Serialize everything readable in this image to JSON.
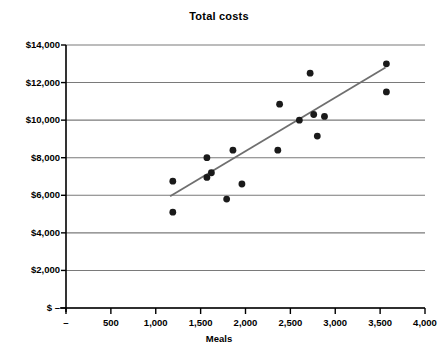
{
  "chart_data": {
    "type": "scatter",
    "title": "Total costs",
    "xlabel": "Meals",
    "ylabel": "",
    "xlim": [
      0,
      4000
    ],
    "ylim": [
      0,
      14000
    ],
    "grid": "horizontal",
    "legend": "none",
    "x_tick_labels": [
      "–",
      "500",
      "1,000",
      "1,500",
      "2,000",
      "2,500",
      "3,000",
      "3,500",
      "4,000"
    ],
    "x_tick_values": [
      0,
      500,
      1000,
      1500,
      2000,
      2500,
      3000,
      3500,
      4000
    ],
    "y_tick_labels": [
      "$14,000",
      "$12,000",
      "$10,000",
      "$8,000",
      "$6,000",
      "$4,000",
      "$2,000",
      "$ –"
    ],
    "y_tick_values": [
      14000,
      12000,
      10000,
      8000,
      6000,
      4000,
      2000,
      0
    ],
    "points": [
      {
        "x": 1190,
        "y": 6750
      },
      {
        "x": 1190,
        "y": 5100
      },
      {
        "x": 1570,
        "y": 8000
      },
      {
        "x": 1570,
        "y": 6950
      },
      {
        "x": 1620,
        "y": 7200
      },
      {
        "x": 1790,
        "y": 5800
      },
      {
        "x": 1860,
        "y": 8400
      },
      {
        "x": 1960,
        "y": 6600
      },
      {
        "x": 2360,
        "y": 8400
      },
      {
        "x": 2380,
        "y": 10850
      },
      {
        "x": 2600,
        "y": 10000
      },
      {
        "x": 2720,
        "y": 12500
      },
      {
        "x": 2760,
        "y": 10300
      },
      {
        "x": 2800,
        "y": 9150
      },
      {
        "x": 2880,
        "y": 10200
      },
      {
        "x": 3570,
        "y": 13000
      },
      {
        "x": 3570,
        "y": 11500
      }
    ],
    "trendline": {
      "x_start": 1160,
      "y_start": 5950,
      "x_end": 3560,
      "y_end": 12800,
      "color": "#6f6f6f"
    },
    "point_color": "#1a1a1a",
    "axis_color": "#000000",
    "grid_color": "#7a7a7a"
  }
}
